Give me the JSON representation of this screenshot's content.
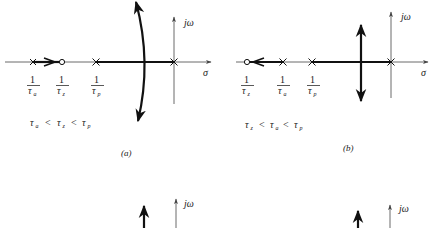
{
  "figure": {
    "panels": [
      {
        "id": "a",
        "caption": "(a)",
        "axis_labels": {
          "imag": "jω",
          "real": "σ"
        },
        "markers": [
          {
            "type": "pole",
            "label_num": "1",
            "label_den": "τ",
            "label_sub": "a"
          },
          {
            "type": "zero",
            "label_num": "1",
            "label_den": "τ",
            "label_sub": "z"
          },
          {
            "type": "pole",
            "label_num": "1",
            "label_den": "τ",
            "label_sub": "p"
          },
          {
            "type": "pole",
            "location": "origin"
          }
        ],
        "condition": {
          "t1": "τ",
          "s1": "a",
          "op1": "<",
          "t2": "τ",
          "s2": "z",
          "op2": "<",
          "t3": "τ",
          "s3": "p"
        },
        "branch": "curved locus bending right, crossing real axis between 1/τp and origin"
      },
      {
        "id": "b",
        "caption": "(b)",
        "axis_labels": {
          "imag": "jω",
          "real": "σ"
        },
        "markers": [
          {
            "type": "zero",
            "label_num": "1",
            "label_den": "τ",
            "label_sub": "z"
          },
          {
            "type": "pole",
            "label_num": "1",
            "label_den": "τ",
            "label_sub": "a"
          },
          {
            "type": "pole",
            "label_num": "1",
            "label_den": "τ",
            "label_sub": "p"
          },
          {
            "type": "pole",
            "location": "origin"
          }
        ],
        "condition": {
          "t1": "τ",
          "s1": "z",
          "op1": "<",
          "t2": "τ",
          "s2": "a",
          "op2": "<",
          "t3": "τ",
          "s3": "p"
        },
        "branch": "vertical asymptote locus between 1/τp and origin"
      },
      {
        "id": "c",
        "axis_labels": {
          "imag": "jω"
        },
        "partial": true
      },
      {
        "id": "d",
        "axis_labels": {
          "imag": "jω"
        },
        "partial": true
      }
    ]
  }
}
